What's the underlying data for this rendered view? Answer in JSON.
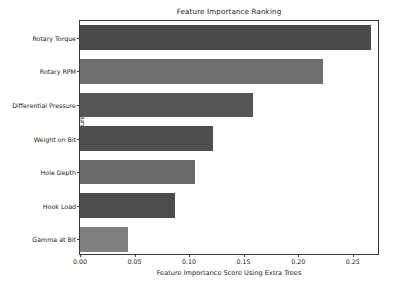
{
  "chart_data": {
    "type": "bar",
    "orientation": "horizontal",
    "title": "Feature Importance Ranking",
    "xlabel": "Feature Importance Score Using Extra Trees",
    "ylabel": "Features",
    "categories": [
      "Rotary Torque",
      "Rotary RPM",
      "Differential Pressure",
      "Weight on Bit",
      "Hole Depth",
      "Hook Load",
      "Gamma at Bit"
    ],
    "values": [
      0.267,
      0.223,
      0.159,
      0.122,
      0.105,
      0.087,
      0.044
    ],
    "bar_colors": [
      "#4a4a4a",
      "#6e6e6e",
      "#555555",
      "#4e4e4e",
      "#6a6a6a",
      "#4c4c4c",
      "#808080"
    ],
    "xlim": [
      0.0,
      0.275
    ],
    "xticks": [
      0.0,
      0.05,
      0.1,
      0.15,
      0.2,
      0.25
    ],
    "xtick_labels": [
      "0.00",
      "0.05",
      "0.10",
      "0.15",
      "0.20",
      "0.25"
    ],
    "grid": false,
    "legend": false,
    "frame_color": "#3b3b3b",
    "background": "#ffffff"
  }
}
